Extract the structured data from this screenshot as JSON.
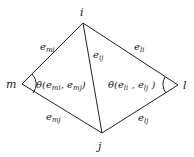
{
  "diagram": {
    "vertices": [
      {
        "id": "i",
        "label": "i",
        "x": 83,
        "y": 23
      },
      {
        "id": "j",
        "label": "j",
        "x": 102,
        "y": 133
      },
      {
        "id": "m",
        "label": "m",
        "x": 22,
        "y": 84
      },
      {
        "id": "l",
        "label": "l",
        "x": 178,
        "y": 85
      }
    ],
    "edges": [
      {
        "from": "m",
        "to": "i",
        "label": "e",
        "sub": "mi"
      },
      {
        "from": "i",
        "to": "j",
        "label": "e",
        "sub": "ij"
      },
      {
        "from": "i",
        "to": "l",
        "label": "e",
        "sub": "li"
      },
      {
        "from": "m",
        "to": "j",
        "label": "e",
        "sub": "mj"
      },
      {
        "from": "j",
        "to": "l",
        "label": "e",
        "sub": "lj"
      }
    ],
    "angles": [
      {
        "at": "m",
        "text_prefix": "θ(",
        "a": "e",
        "a_sub": "mi",
        "sep": ", ",
        "b": "e",
        "b_sub": "mj",
        "suffix": ")"
      },
      {
        "at": "l",
        "text_prefix": "θ(",
        "a": "e",
        "a_sub": "li",
        "sep": " , ",
        "b": "e",
        "b_sub": "lj",
        "suffix": " )"
      }
    ]
  }
}
